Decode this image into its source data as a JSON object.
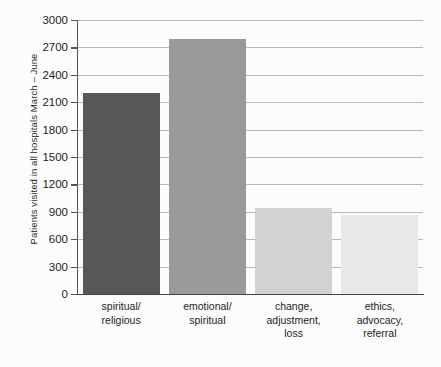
{
  "chart_data": {
    "type": "bar",
    "title": "",
    "xlabel": "",
    "ylabel": "Patients visited in all hospitals March – June",
    "categories": [
      "spiritual/\nreligious",
      "emotional/\nspiritual",
      "change,\nadjustment,\nloss",
      "ethics,\nadvocacy,\nreferral"
    ],
    "values": [
      2200,
      2790,
      940,
      860
    ],
    "ylim": [
      0,
      3000
    ],
    "yticks": [
      0,
      300,
      600,
      900,
      1200,
      1500,
      1800,
      2100,
      2400,
      2700,
      3000
    ],
    "ytick_labels": [
      "0",
      "300",
      "600",
      "900",
      "1200",
      "1500",
      "1800",
      "2100",
      "2400",
      "2700",
      "3000"
    ],
    "bar_colors": [
      "#575757",
      "#9a9a9a",
      "#d2d2d2",
      "#e8e8e8"
    ],
    "grid": "horizontal",
    "legend": "none",
    "background_color": "#fcfcfc",
    "gridline_color": "#b8b8b8",
    "axis_color": "#555555"
  }
}
